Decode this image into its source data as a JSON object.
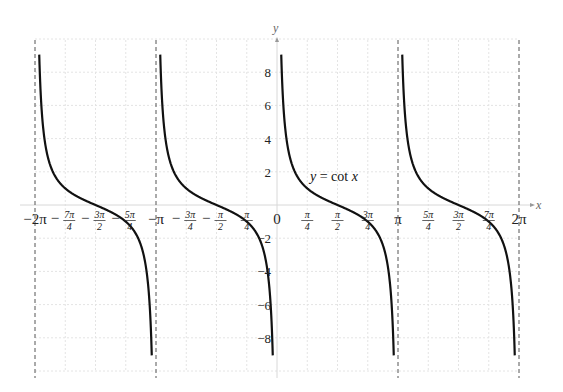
{
  "chart_data": {
    "type": "line",
    "title": "",
    "xlabel": "x",
    "ylabel": "y",
    "xlim_over_pi": [
      -2,
      2
    ],
    "ylim": [
      -10,
      10
    ],
    "grid": true,
    "function": "cot",
    "annotation": {
      "text_y": "y",
      "text_eq": " = cot ",
      "text_x": "x"
    },
    "asymptotes_over_pi": [
      -2,
      -1,
      0,
      1,
      2
    ],
    "x_ticks": [
      {
        "v": -2,
        "kind": "int",
        "label": "−2π"
      },
      {
        "v": -1.75,
        "kind": "frac",
        "sign": "−",
        "num": "7π",
        "den": "4"
      },
      {
        "v": -1.5,
        "kind": "frac",
        "sign": "−",
        "num": "3π",
        "den": "2"
      },
      {
        "v": -1.25,
        "kind": "frac",
        "sign": "−",
        "num": "5π",
        "den": "4"
      },
      {
        "v": -1,
        "kind": "int",
        "label": "−π"
      },
      {
        "v": -0.75,
        "kind": "frac",
        "sign": "−",
        "num": "3π",
        "den": "4"
      },
      {
        "v": -0.5,
        "kind": "frac",
        "sign": "−",
        "num": "π",
        "den": "2"
      },
      {
        "v": -0.25,
        "kind": "frac",
        "sign": "",
        "num": "π",
        "den": "4"
      },
      {
        "v": 0,
        "kind": "int",
        "label": "0"
      },
      {
        "v": 0.25,
        "kind": "frac",
        "sign": "",
        "num": "π",
        "den": "4"
      },
      {
        "v": 0.5,
        "kind": "frac",
        "sign": "",
        "num": "π",
        "den": "2"
      },
      {
        "v": 0.75,
        "kind": "frac",
        "sign": "",
        "num": "3π",
        "den": "4"
      },
      {
        "v": 1,
        "kind": "int",
        "label": "π"
      },
      {
        "v": 1.25,
        "kind": "frac",
        "sign": "",
        "num": "5π",
        "den": "4"
      },
      {
        "v": 1.5,
        "kind": "frac",
        "sign": "",
        "num": "3π",
        "den": "2"
      },
      {
        "v": 1.75,
        "kind": "frac",
        "sign": "",
        "num": "7π",
        "den": "4"
      },
      {
        "v": 2,
        "kind": "int",
        "label": "2π"
      }
    ],
    "y_ticks": [
      {
        "v": 8,
        "label": "8"
      },
      {
        "v": 6,
        "label": "6"
      },
      {
        "v": 4,
        "label": "4"
      },
      {
        "v": 2,
        "label": "2"
      },
      {
        "v": -2,
        "label": "−2"
      },
      {
        "v": -4,
        "label": "−4"
      },
      {
        "v": -6,
        "label": "−6"
      },
      {
        "v": -8,
        "label": "−8"
      }
    ],
    "series": [
      {
        "name": "y = cot x",
        "branch_over_pi": [
          -2,
          -1
        ]
      },
      {
        "name": "y = cot x",
        "branch_over_pi": [
          -1,
          0
        ]
      },
      {
        "name": "y = cot x",
        "branch_over_pi": [
          0,
          1
        ]
      },
      {
        "name": "y = cot x",
        "branch_over_pi": [
          1,
          2
        ]
      }
    ]
  }
}
